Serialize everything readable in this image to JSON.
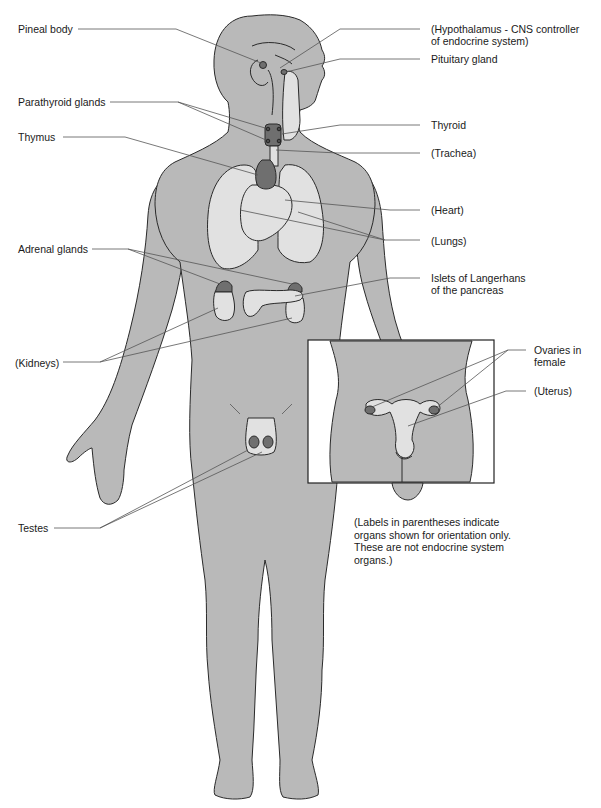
{
  "diagram": {
    "colors": {
      "body": "#b9b9b9",
      "organ_nonendocrine": "#e1e1e1",
      "endocrine_gland": "#6f6f6f",
      "outline": "#2a2a2a",
      "background": "#ffffff"
    },
    "labels_left": [
      {
        "id": "pineal",
        "text": "Pineal body"
      },
      {
        "id": "parathyroid",
        "text": "Parathyroid glands"
      },
      {
        "id": "thymus",
        "text": "Thymus"
      },
      {
        "id": "adrenal",
        "text": "Adrenal glands"
      },
      {
        "id": "kidneys",
        "text": "(Kidneys)"
      },
      {
        "id": "testes",
        "text": "Testes"
      }
    ],
    "labels_right": [
      {
        "id": "hypothalamus",
        "line1": "(Hypothalamus - CNS controller",
        "line2": "of endocrine system)"
      },
      {
        "id": "pituitary",
        "text": "Pituitary gland"
      },
      {
        "id": "thyroid",
        "text": "Thyroid"
      },
      {
        "id": "trachea",
        "text": "(Trachea)"
      },
      {
        "id": "heart",
        "text": "(Heart)"
      },
      {
        "id": "lungs",
        "text": "(Lungs)"
      },
      {
        "id": "islets",
        "line1": "Islets of Langerhans",
        "line2": "of the pancreas"
      },
      {
        "id": "ovaries",
        "line1": "Ovaries in",
        "line2": "female"
      },
      {
        "id": "uterus",
        "text": "(Uterus)"
      }
    ],
    "inset": {
      "name": "Female pelvis inset",
      "shows": [
        "Ovaries",
        "Uterus"
      ]
    },
    "note": "(Labels in parentheses indicate\norgans shown for orientation only.\nThese are not endocrine system\norgans.)"
  }
}
